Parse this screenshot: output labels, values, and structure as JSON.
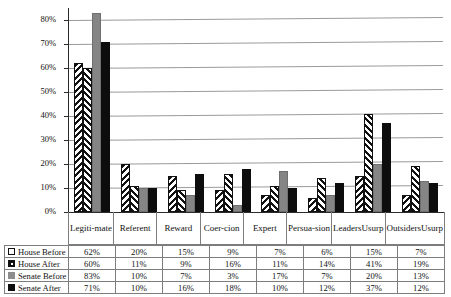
{
  "chart_data": {
    "type": "bar",
    "title": "",
    "xlabel": "",
    "ylabel": "",
    "ylim": [
      0,
      85
    ],
    "ytick_labels": [
      "0%",
      "10%",
      "20%",
      "30%",
      "40%",
      "50%",
      "60%",
      "70%",
      "80%"
    ],
    "ytick_values": [
      0,
      10,
      20,
      30,
      40,
      50,
      60,
      70,
      80
    ],
    "grid": true,
    "legend_position": "bottom-table",
    "categories": [
      "Legiti-\nmate",
      "Referent",
      "Reward",
      "Coer-\ncion",
      "Expert",
      "Persua-\nsion",
      "Leaders\nUsurp",
      "Outsiders\nUsurp"
    ],
    "series": [
      {
        "name": "House Before",
        "marker": "white-square-icon",
        "pattern": "chevron-hatch",
        "color": "#ffffff",
        "values": [
          62,
          20,
          15,
          9,
          7,
          6,
          15,
          7
        ],
        "labels": [
          "62%",
          "20%",
          "15%",
          "9%",
          "7%",
          "6%",
          "15%",
          "7%"
        ]
      },
      {
        "name": "House After",
        "marker": "black-square-dot-icon",
        "pattern": "chevron-hatch-mirrored",
        "color": "#ffffff",
        "values": [
          60,
          11,
          9,
          16,
          11,
          14,
          41,
          19
        ],
        "labels": [
          "60%",
          "11%",
          "9%",
          "16%",
          "11%",
          "14%",
          "41%",
          "19%"
        ]
      },
      {
        "name": "Senate Before",
        "marker": "gray-square-icon",
        "pattern": "solid",
        "color": "#858585",
        "values": [
          83,
          10,
          7,
          3,
          17,
          7,
          20,
          13
        ],
        "labels": [
          "83%",
          "10%",
          "7%",
          "3%",
          "17%",
          "7%",
          "20%",
          "13%"
        ]
      },
      {
        "name": "Senate After",
        "marker": "black-square-icon",
        "pattern": "solid",
        "color": "#0d0d0d",
        "values": [
          71,
          10,
          16,
          18,
          10,
          12,
          37,
          12
        ],
        "labels": [
          "71%",
          "10%",
          "16%",
          "18%",
          "10%",
          "12%",
          "37%",
          "12%"
        ]
      }
    ]
  },
  "table": {
    "rows": [
      {
        "label": "House Before",
        "values": [
          "62%",
          "20%",
          "15%",
          "9%",
          "7%",
          "6%",
          "15%",
          "7%"
        ]
      },
      {
        "label": "House After",
        "values": [
          "60%",
          "11%",
          "9%",
          "16%",
          "11%",
          "14%",
          "41%",
          "19%"
        ]
      },
      {
        "label": "Senate Before",
        "values": [
          "83%",
          "10%",
          "7%",
          "3%",
          "17%",
          "7%",
          "20%",
          "13%"
        ]
      },
      {
        "label": "Senate After",
        "values": [
          "71%",
          "10%",
          "16%",
          "18%",
          "10%",
          "12%",
          "37%",
          "12%"
        ]
      }
    ]
  },
  "category_labels": [
    {
      "line1": "Legiti-",
      "line2": "mate"
    },
    {
      "line1": "Referent",
      "line2": ""
    },
    {
      "line1": "Reward",
      "line2": ""
    },
    {
      "line1": "Coer-",
      "line2": "cion"
    },
    {
      "line1": "Expert",
      "line2": ""
    },
    {
      "line1": "Persua-",
      "line2": "sion"
    },
    {
      "line1": "Leaders",
      "line2": "Usurp"
    },
    {
      "line1": "Outsiders",
      "line2": "Usurp"
    }
  ],
  "colors": {
    "gridline": "#9a9a9a",
    "axis": "#2b2b2b",
    "senate_before": "#858585",
    "senate_after": "#0d0d0d",
    "border": "#7d7d7d"
  }
}
